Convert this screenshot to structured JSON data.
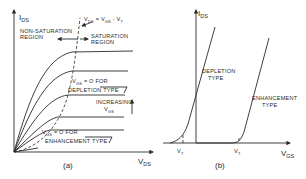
{
  "figure": {
    "panel_a": {
      "caption": "(a)",
      "y_axis_label": "I",
      "y_axis_sub": "DS",
      "x_axis_label": "V",
      "x_axis_sub": "DS",
      "boundary_label": "V_DS = V_GS - V_T",
      "boundary_label_parts": {
        "v1": "V",
        "s1": "DS",
        "eq": " = V",
        "s2": "GS",
        "minus": " - V",
        "s3": "T"
      },
      "nonsat_region": [
        "NON-SATURATION",
        "REGION"
      ],
      "sat_region": [
        "SATURATION",
        "REGION"
      ],
      "depletion_note": {
        "v": "V",
        "sub": "GS",
        "rest": " = O  FOR",
        "line2": "DEPLETION TYPE"
      },
      "enhancement_note": {
        "v": "V",
        "sub": "GS",
        "rest": " = O  FOR",
        "line2": "ENHANCEMENT TYPE"
      },
      "increasing_label": [
        "INCREASING",
        "V",
        "GS"
      ],
      "curve_count": 5
    },
    "panel_b": {
      "caption": "(b)",
      "y_axis_label": "I",
      "y_axis_sub": "DS",
      "x_axis_label": "V",
      "x_axis_sub": "GS",
      "depletion_label": [
        "DEPLETION",
        "TYPE"
      ],
      "enhancement_label": [
        "ENHANCEMENT",
        "TYPE"
      ],
      "vt_label": "V",
      "vt_sub": "T"
    }
  }
}
